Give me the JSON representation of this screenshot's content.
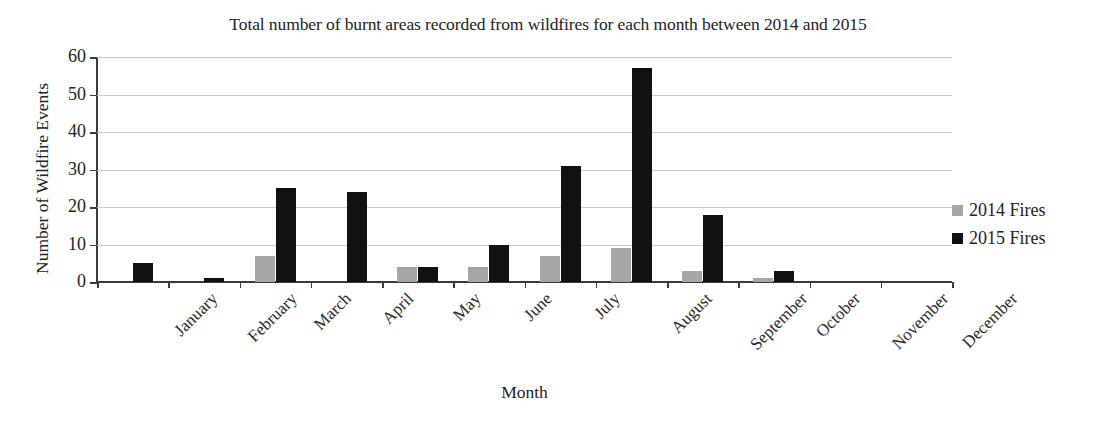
{
  "chart_data": {
    "type": "bar",
    "title": "Total number of burnt areas recorded from wildfires for each month between 2014 and 2015",
    "xlabel": "Month",
    "ylabel": "Number of Wildfire Events",
    "categories": [
      "January",
      "February",
      "March",
      "April",
      "May",
      "June",
      "July",
      "August",
      "September",
      "October",
      "November",
      "December"
    ],
    "series": [
      {
        "name": "2014 Fires",
        "color": "#a6a6a6",
        "values": [
          0,
          0,
          7,
          0,
          4,
          4,
          7,
          9,
          3,
          1,
          0,
          0
        ]
      },
      {
        "name": "2015 Fires",
        "color": "#111111",
        "values": [
          5,
          1,
          25,
          24,
          4,
          10,
          31,
          57,
          18,
          3,
          0,
          0
        ]
      }
    ],
    "ylim": [
      0,
      60
    ],
    "yticks": [
      0,
      10,
      20,
      30,
      40,
      50,
      60
    ],
    "ytick_labels": [
      "0",
      "10",
      "20",
      "30",
      "40",
      "50",
      "60"
    ],
    "grid": true,
    "legend_position": "right"
  }
}
